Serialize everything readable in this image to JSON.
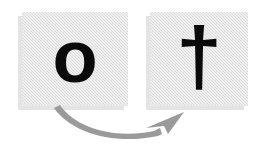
{
  "diagram": {
    "background_color": "#ffffff",
    "card_fill_color": "#dcdcdc",
    "card_shadow_color": "#e4e4e4",
    "glyph_color": "#0a0a0a",
    "arrow_color": "#9a9a9a",
    "source": {
      "glyph": "o",
      "glyph_name": "letter-o",
      "label": "o"
    },
    "target": {
      "glyph": "†",
      "glyph_name": "dagger-cross",
      "label": "†"
    },
    "arrow": {
      "name": "curved-arrow",
      "direction": "left-to-right",
      "style": "curved"
    }
  }
}
